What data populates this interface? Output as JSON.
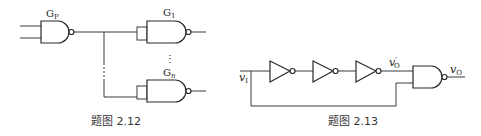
{
  "figures": [
    {
      "id": "2.12",
      "caption": "题图 2.12",
      "gates": {
        "driver": {
          "type": "NAND",
          "label_main": "G",
          "label_sub": "P"
        },
        "load_first": {
          "type": "NAND",
          "label_main": "G",
          "label_sub": "1"
        },
        "load_last": {
          "type": "NAND",
          "label_main": "G",
          "label_sub": "n"
        }
      },
      "ellipsis_vertical": "⋮"
    },
    {
      "id": "2.13",
      "caption": "题图 2.13",
      "input_label": {
        "main": "v",
        "sub": "I"
      },
      "intermediate_label": {
        "main": "v",
        "prime": "′",
        "sub": "O"
      },
      "output_label": {
        "main": "v",
        "sub": "O"
      },
      "gates": [
        {
          "type": "NOT"
        },
        {
          "type": "NOT"
        },
        {
          "type": "NOT"
        },
        {
          "type": "NAND"
        }
      ]
    }
  ],
  "colors": {
    "line": "#2a2a2a",
    "background": "#ffffff",
    "text": "#222222"
  }
}
